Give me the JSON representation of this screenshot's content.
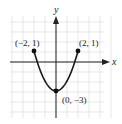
{
  "chart_data": {
    "type": "line",
    "title": "",
    "xlabel": "x",
    "ylabel": "y",
    "xlim": [
      -4,
      5
    ],
    "ylim": [
      -5,
      4
    ],
    "grid": true,
    "function": "y = x^2 - 3, for -2 <= x <= 2",
    "series": [
      {
        "name": "parabola",
        "x": [
          -2,
          -1.5,
          -1,
          -0.5,
          0,
          0.5,
          1,
          1.5,
          2
        ],
        "y": [
          1,
          -0.75,
          -2,
          -2.75,
          -3,
          -2.75,
          -2,
          -0.75,
          1
        ]
      }
    ],
    "points": [
      {
        "x": -2,
        "y": 1,
        "label": "(−2, 1)"
      },
      {
        "x": 2,
        "y": 1,
        "label": "(2, 1)"
      },
      {
        "x": 0,
        "y": -3,
        "label": "(0, −3)"
      }
    ],
    "colors": {
      "curve": "#1a1a1a",
      "grid": "#d9d9d9",
      "axes": "#222222"
    }
  },
  "labels": {
    "x_axis": "x",
    "y_axis": "y",
    "point_left": "(−2, 1)",
    "point_right": "(2, 1)",
    "point_vertex": "(0, −3)"
  }
}
